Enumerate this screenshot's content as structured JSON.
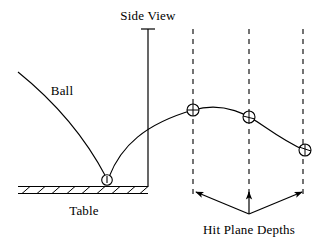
{
  "figure": {
    "width": 323,
    "height": 249,
    "background": "#ffffff",
    "stroke_color": "#000000"
  },
  "labels": {
    "side_view": "Side View",
    "ball": "Ball",
    "table": "Table",
    "hit_plane_depths": "Hit Plane Depths"
  },
  "diagram": {
    "type": "schematic",
    "title": "Side View",
    "description_elements": [
      "ball-trajectory",
      "table-surface",
      "side-view-divider",
      "hit-plane-dashed-lines",
      "hit-plane-arrows"
    ],
    "net_line": {
      "x": 148,
      "y_top": 29,
      "y_bottom": 186,
      "cap_half_width": 7
    },
    "table": {
      "x_start": 18,
      "x_end": 148,
      "y_top": 186,
      "y_bottom": 193,
      "hatch_count": 9
    },
    "bounce_point": {
      "x": 107,
      "y": 180,
      "radius": 5
    },
    "incoming_path": {
      "start_x": 18,
      "start_y": 72,
      "end_x": 107,
      "end_y": 180
    },
    "hit_planes": [
      {
        "x": 193,
        "y_top": 29,
        "y_bottom": 196,
        "ball_x": 193,
        "ball_y": 110,
        "radius": 6
      },
      {
        "x": 249,
        "y_top": 29,
        "y_bottom": 196,
        "ball_x": 249,
        "ball_y": 117,
        "radius": 6
      },
      {
        "x": 303,
        "y_top": 29,
        "y_bottom": 196,
        "ball_x": 305,
        "ball_y": 150,
        "radius": 6
      }
    ],
    "arrow_origin": {
      "x": 249,
      "y": 214
    },
    "arrow_tips": [
      {
        "x": 196,
        "y": 192
      },
      {
        "x": 249,
        "y": 192
      },
      {
        "x": 302,
        "y": 192
      }
    ]
  }
}
